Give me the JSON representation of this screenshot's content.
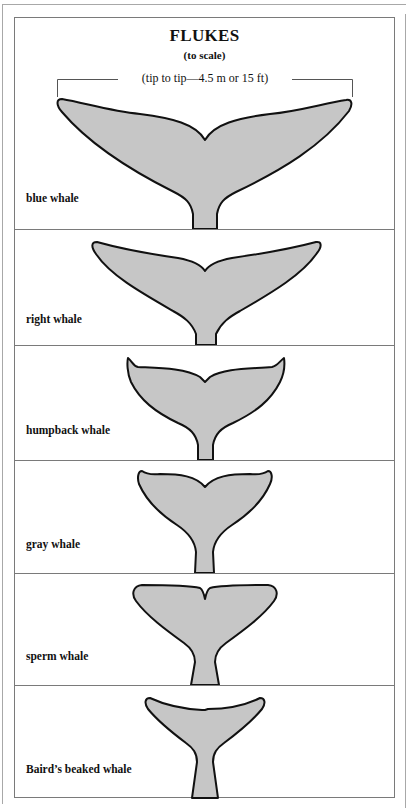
{
  "header": {
    "title": "FLUKES",
    "subtitle": "(to scale)",
    "measurement": "(tip to tip—4.5 m or 15 ft)"
  },
  "colors": {
    "fluke_fill": "#c6c6c6",
    "fluke_outline": "#111111",
    "frame": "#7a7a7a"
  },
  "panels": [
    {
      "label": "blue whale"
    },
    {
      "label": "right whale"
    },
    {
      "label": "humpback whale"
    },
    {
      "label": "gray whale"
    },
    {
      "label": "sperm whale"
    },
    {
      "label": "Baird’s beaked whale"
    }
  ]
}
